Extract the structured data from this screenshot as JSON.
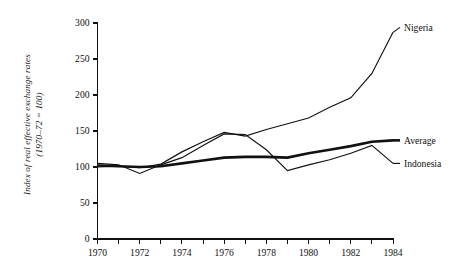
{
  "chart_data": {
    "type": "line",
    "title": "",
    "xlabel": "",
    "ylabel": "Index of real effective exchange rates",
    "ylabel_line2": "(1970–72 = 100)",
    "xlim": [
      1970,
      1984
    ],
    "ylim": [
      0,
      300
    ],
    "grid": false,
    "legend_position": "right-inline",
    "x": [
      1970,
      1971,
      1972,
      1973,
      1974,
      1975,
      1976,
      1977,
      1978,
      1979,
      1980,
      1981,
      1982,
      1983,
      1984
    ],
    "xticks": [
      1970,
      1972,
      1974,
      1976,
      1978,
      1980,
      1982,
      1984
    ],
    "xtick_labels": [
      "1970",
      "1972",
      "1974",
      "1976",
      "1978",
      "1980",
      "1982",
      "1984"
    ],
    "xminor_ticks": [
      1971,
      1973,
      1975,
      1977,
      1979,
      1981,
      1983
    ],
    "yticks": [
      0,
      50,
      100,
      150,
      200,
      250,
      300
    ],
    "ytick_labels": [
      "0",
      "50",
      "100",
      "150",
      "200",
      "250",
      "300"
    ],
    "series": [
      {
        "name": "Nigeria",
        "style": "thin",
        "values": [
          100,
          101,
          99,
          104,
          121,
          135,
          148,
          143,
          152,
          160,
          168,
          183,
          196,
          230,
          287
        ]
      },
      {
        "name": "Average",
        "style": "thick",
        "values": [
          102,
          101,
          100,
          101,
          105,
          109,
          113,
          114,
          114,
          113,
          119,
          124,
          129,
          135,
          137
        ]
      },
      {
        "name": "Indonesia",
        "style": "thin",
        "values": [
          105,
          103,
          91,
          103,
          113,
          130,
          146,
          145,
          124,
          95,
          103,
          110,
          119,
          130,
          105
        ]
      }
    ]
  },
  "axis": {
    "y_axis_name": "y-axis",
    "x_axis_name": "x-axis"
  }
}
